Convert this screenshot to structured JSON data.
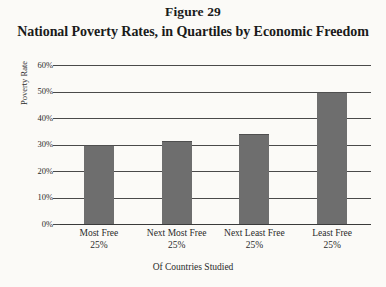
{
  "figure": {
    "number": "Figure 29",
    "title": "National Poverty Rates, in Quartiles by Economic Freedom"
  },
  "chart_data": {
    "type": "bar",
    "title": "National Poverty Rates, in Quartiles by Economic Freedom",
    "subtitle": "Figure 29",
    "xlabel": "Of Countries Studied",
    "ylabel": "Poverty Rate",
    "categories": [
      "Most Free 25%",
      "Next Most Free 25%",
      "Next Least Free 25%",
      "Least Free 25%"
    ],
    "category_lines": [
      {
        "line1": "Most Free",
        "line2": "25%"
      },
      {
        "line1": "Next Most Free",
        "line2": "25%"
      },
      {
        "line1": "Next Least Free",
        "line2": "25%"
      },
      {
        "line1": "Least Free",
        "line2": "25%"
      }
    ],
    "values": [
      30,
      31.5,
      34,
      50
    ],
    "value_labels": [
      "30%",
      "31.5%",
      "34%",
      "50%"
    ],
    "ylim": [
      0,
      60
    ],
    "ytick_values": [
      60,
      50,
      40,
      30,
      20,
      10,
      0
    ],
    "ytick_labels": [
      "60%",
      "50%",
      "40%",
      "30%",
      "20%",
      "10%",
      "0%"
    ],
    "grid": true,
    "legend": "none",
    "bar_color": "#6e6e6e",
    "background_color": "#fbfaf7",
    "axis_color": "#4a4a4a"
  }
}
